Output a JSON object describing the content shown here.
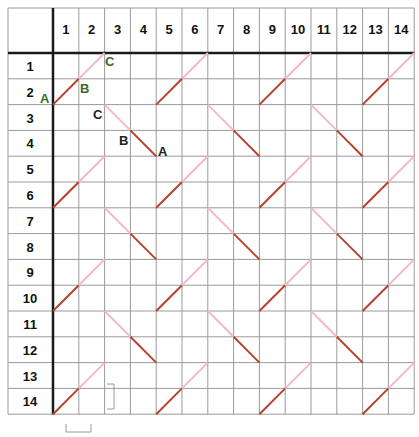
{
  "grid": {
    "columns": [
      "1",
      "2",
      "3",
      "4",
      "5",
      "6",
      "7",
      "8",
      "9",
      "10",
      "11",
      "12",
      "13",
      "14"
    ],
    "rows": [
      "1",
      "2",
      "3",
      "4",
      "5",
      "6",
      "7",
      "8",
      "9",
      "10",
      "11",
      "12",
      "13",
      "14"
    ]
  },
  "colors": {
    "grid_line": "#9a9a9a",
    "axis_line": "#1a1a1a",
    "stitch_dark": "#b5432e",
    "stitch_light": "#f2b8cc",
    "label_green": "#3f6a2a",
    "label_dark": "#222222",
    "bracket": "#9a9a9a"
  },
  "diagonals_up": {
    "description": "rising stitches, dark lower half then light upper half",
    "row_starts": [
      2,
      6,
      10,
      14
    ],
    "col_starts": [
      0,
      4,
      8,
      12
    ]
  },
  "diagonals_down": {
    "description": "falling stitches, light upper half then dark lower half",
    "row_starts": [
      2,
      6,
      10
    ],
    "col_starts": [
      2,
      6,
      10
    ]
  },
  "labels": [
    {
      "text": "C",
      "color": "green",
      "x": 105,
      "y": 66
    },
    {
      "text": "B",
      "color": "green",
      "x": 80,
      "y": 93
    },
    {
      "text": "A",
      "color": "green",
      "x": 40,
      "y": 103
    },
    {
      "text": "C",
      "color": "dark",
      "x": 93,
      "y": 119
    },
    {
      "text": "B",
      "color": "dark",
      "x": 119,
      "y": 145
    },
    {
      "text": "A",
      "color": "dark",
      "x": 158,
      "y": 156
    }
  ]
}
